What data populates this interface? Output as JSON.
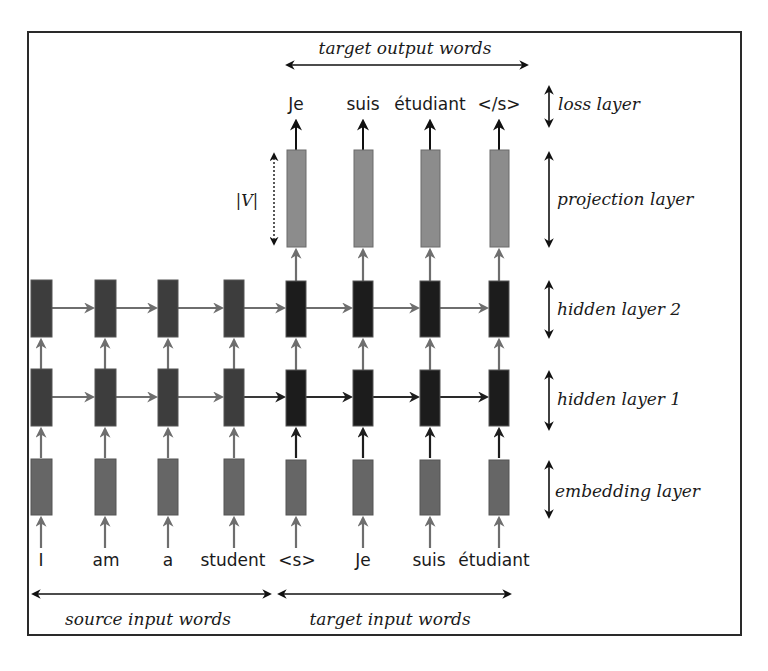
{
  "top_label": "target output words",
  "bottom_labels": {
    "source": "source input words",
    "target": "target input words"
  },
  "vocab_size_label": "|V|",
  "layers": [
    {
      "id": "loss",
      "label": "loss layer"
    },
    {
      "id": "projection",
      "label": "projection layer"
    },
    {
      "id": "hidden2",
      "label": "hidden layer 2"
    },
    {
      "id": "hidden1",
      "label": "hidden layer 1"
    },
    {
      "id": "embedding",
      "label": "embedding layer"
    }
  ],
  "source_input_words": [
    "I",
    "am",
    "a",
    "student"
  ],
  "target_input_words": [
    "<s>",
    "Je",
    "suis",
    "étudiant"
  ],
  "target_output_words": [
    "Je",
    "suis",
    "étudiant",
    "</s>"
  ],
  "colors": {
    "source_hidden": "#3d3d3d",
    "target_hidden": "#1c1c1c",
    "embedding": "#666666",
    "projection": "#8c8c8c",
    "arrow_gray": "#6e6e6e",
    "arrow_dark": "#1e1e1e",
    "border": "#2a2a2a"
  }
}
